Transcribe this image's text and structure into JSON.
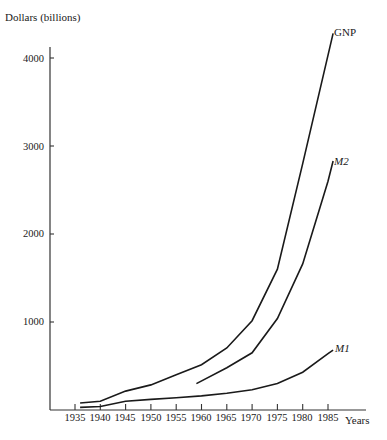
{
  "chart_data": {
    "type": "line",
    "title": "",
    "ylabel": "Dollars (billions)",
    "xlabel": "Years",
    "xlim": [
      1931,
      1992
    ],
    "ylim": [
      0,
      4300
    ],
    "grid": false,
    "legend": "direct labels at line ends",
    "x_ticks": [
      1935,
      1940,
      1945,
      1950,
      1955,
      1960,
      1965,
      1970,
      1975,
      1980,
      1985
    ],
    "y_ticks": [
      1000,
      2000,
      3000,
      4000
    ],
    "series": [
      {
        "name": "GNP",
        "label_italic": false,
        "points": [
          [
            1936,
            80
          ],
          [
            1940,
            100
          ],
          [
            1945,
            215
          ],
          [
            1950,
            285
          ],
          [
            1955,
            400
          ],
          [
            1960,
            515
          ],
          [
            1965,
            705
          ],
          [
            1970,
            1015
          ],
          [
            1975,
            1600
          ],
          [
            1980,
            2800
          ],
          [
            1986,
            4280
          ]
        ]
      },
      {
        "name": "M2",
        "label_italic": true,
        "points": [
          [
            1959,
            300
          ],
          [
            1965,
            480
          ],
          [
            1970,
            650
          ],
          [
            1975,
            1040
          ],
          [
            1980,
            1660
          ],
          [
            1985,
            2600
          ],
          [
            1986,
            2830
          ]
        ]
      },
      {
        "name": "M1",
        "label_italic": true,
        "points": [
          [
            1936,
            30
          ],
          [
            1940,
            40
          ],
          [
            1945,
            100
          ],
          [
            1950,
            120
          ],
          [
            1955,
            140
          ],
          [
            1960,
            160
          ],
          [
            1965,
            190
          ],
          [
            1970,
            230
          ],
          [
            1975,
            300
          ],
          [
            1980,
            430
          ],
          [
            1985,
            640
          ],
          [
            1986,
            680
          ]
        ]
      }
    ]
  },
  "labels": {
    "y_title": "Dollars (billions)",
    "x_title": "Years",
    "y_ticks": [
      "4000",
      "3000",
      "2000",
      "1000"
    ],
    "x_ticks": [
      "1935",
      "1940",
      "1945",
      "1950",
      "1955",
      "1960",
      "1965",
      "1970",
      "1975",
      "1980",
      "1985"
    ],
    "series": [
      "GNP",
      "M2",
      "M1"
    ]
  },
  "colors": {
    "line": "#1a1a1a",
    "axis": "#333333",
    "background": "#ffffff"
  }
}
